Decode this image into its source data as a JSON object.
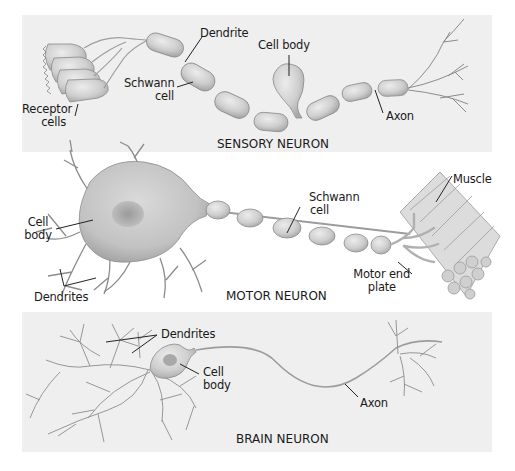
{
  "diagram": {
    "panels": [
      {
        "id": "sensory",
        "title": "SENSORY NEURON",
        "labels": {
          "dendrite": "Dendrite",
          "cell_body": "Cell body",
          "schwann_line1": "Schwann",
          "schwann_line2": "cell",
          "receptor_line1": "Receptor",
          "receptor_line2": "cells",
          "axon": "Axon"
        }
      },
      {
        "id": "motor",
        "title": "MOTOR NEURON",
        "labels": {
          "cell_line1": "Cell",
          "cell_line2": "body",
          "dendrites": "Dendrites",
          "schwann_line1": "Schwann",
          "schwann_line2": "cell",
          "muscle": "Muscle",
          "motor_end_line1": "Motor end",
          "motor_end_line2": "plate"
        }
      },
      {
        "id": "brain",
        "title": "BRAIN NEURON",
        "labels": {
          "dendrites": "Dendrites",
          "cell_line1": "Cell",
          "cell_line2": "body",
          "axon": "Axon"
        }
      }
    ],
    "colors": {
      "panel_gray": "#efefef",
      "cell_fill": "#d2d2d2",
      "cell_stroke": "#8a8a8a",
      "nucleus": "#a8a8a8",
      "branch": "#8c8c8c",
      "leader": "#222222"
    }
  }
}
